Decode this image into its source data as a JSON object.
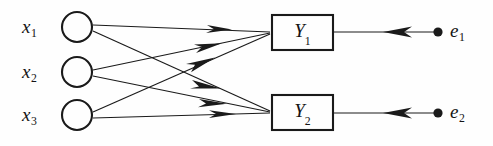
{
  "figure": {
    "type": "path-diagram",
    "background_color": "#fefefe",
    "stroke_color": "#1a1a1a",
    "width": 493,
    "height": 146
  },
  "exogenous_nodes": [
    {
      "id": "x1",
      "label": "x",
      "subscript": "1",
      "shape": "circle",
      "cx": 77,
      "cy": 27,
      "r": 15
    },
    {
      "id": "x2",
      "label": "x",
      "subscript": "2",
      "shape": "circle",
      "cx": 77,
      "cy": 72,
      "r": 15
    },
    {
      "id": "x3",
      "label": "x",
      "subscript": "3",
      "shape": "circle",
      "cx": 77,
      "cy": 115,
      "r": 15
    }
  ],
  "endogenous_nodes": [
    {
      "id": "y1",
      "label": "Y",
      "subscript": "1",
      "shape": "rect",
      "x": 272,
      "y": 15,
      "w": 61,
      "h": 35
    },
    {
      "id": "y2",
      "label": "Y",
      "subscript": "2",
      "shape": "rect",
      "x": 272,
      "y": 95,
      "w": 61,
      "h": 35
    }
  ],
  "error_nodes": [
    {
      "id": "e1",
      "label": "e",
      "subscript": "1",
      "shape": "dot",
      "cx": 438,
      "cy": 32,
      "r": 4.5
    },
    {
      "id": "e2",
      "label": "e",
      "subscript": "2",
      "shape": "dot",
      "cx": 438,
      "cy": 113,
      "r": 4.5
    }
  ],
  "edges": [
    {
      "from": "x1",
      "to": "y1",
      "arrow": "forward"
    },
    {
      "from": "x1",
      "to": "y2",
      "arrow": "forward"
    },
    {
      "from": "x2",
      "to": "y1",
      "arrow": "forward"
    },
    {
      "from": "x2",
      "to": "y2",
      "arrow": "forward"
    },
    {
      "from": "x3",
      "to": "y1",
      "arrow": "forward"
    },
    {
      "from": "x3",
      "to": "y2",
      "arrow": "forward"
    },
    {
      "from": "e1",
      "to": "y1",
      "arrow": "backward"
    },
    {
      "from": "e2",
      "to": "y2",
      "arrow": "backward"
    }
  ],
  "labels": {
    "x1": "x",
    "x1_sub": "1",
    "x2": "x",
    "x2_sub": "2",
    "x3": "x",
    "x3_sub": "3",
    "y1": "Y",
    "y1_sub": "1",
    "y2": "Y",
    "y2_sub": "2",
    "e1": "e",
    "e1_sub": "1",
    "e2": "e",
    "e2_sub": "2"
  }
}
